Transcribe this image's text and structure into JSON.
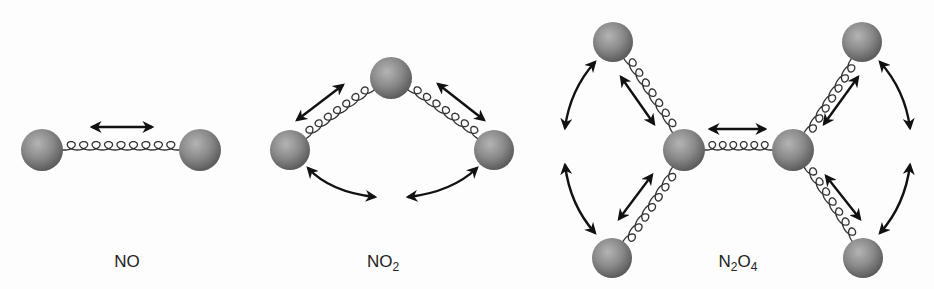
{
  "diagram": {
    "type": "molecular-vibration-modes",
    "molecules": [
      {
        "name": "NO",
        "label_main": "NO",
        "label_sub": "",
        "label_tail": "",
        "label_pos": [
          127,
          252
        ],
        "atoms": [
          [
            42,
            150,
            21
          ],
          [
            200,
            150,
            21
          ]
        ],
        "springs": [
          [
            42,
            150,
            200,
            150,
            9
          ]
        ],
        "straight_arrows": [
          [
            92,
            127,
            152,
            127
          ]
        ],
        "curved_arrows": []
      },
      {
        "name": "NO2",
        "label_main": "NO",
        "label_sub": "2",
        "label_tail": "",
        "label_pos": [
          383,
          252
        ],
        "atoms": [
          [
            290,
            150,
            20
          ],
          [
            391,
            78,
            21
          ],
          [
            494,
            150,
            20
          ]
        ],
        "springs": [
          [
            290,
            150,
            391,
            78,
            7
          ],
          [
            391,
            78,
            494,
            150,
            7
          ]
        ],
        "straight_arrows": [
          [
            297,
            120,
            343,
            85
          ],
          [
            438,
            84,
            484,
            120
          ]
        ],
        "curved_arrows": [
          [
            308,
            168,
            375,
            197,
            330,
            192
          ],
          [
            408,
            197,
            477,
            168,
            452,
            192
          ]
        ]
      },
      {
        "name": "N2O4",
        "label_main": "N",
        "label_sub": "2",
        "label_tail": "O",
        "label_sub2": "4",
        "label_pos": [
          738,
          252
        ],
        "atoms": [
          [
            613,
            42,
            20
          ],
          [
            862,
            42,
            20
          ],
          [
            684,
            150,
            21
          ],
          [
            793,
            150,
            21
          ],
          [
            612,
            258,
            20
          ],
          [
            863,
            258,
            20
          ]
        ],
        "springs": [
          [
            613,
            42,
            684,
            150,
            7
          ],
          [
            684,
            150,
            612,
            258,
            7
          ],
          [
            684,
            150,
            793,
            150,
            6
          ],
          [
            862,
            42,
            793,
            150,
            7
          ],
          [
            793,
            150,
            863,
            258,
            7
          ]
        ],
        "straight_arrows": [
          [
            621,
            77,
            654,
            124
          ],
          [
            619,
            219,
            652,
            175
          ],
          [
            710,
            129,
            765,
            129
          ],
          [
            824,
            124,
            858,
            77
          ],
          [
            826,
            176,
            860,
            219
          ]
        ],
        "curved_arrows": [
          [
            595,
            62,
            565,
            128,
            570,
            90
          ],
          [
            565,
            165,
            595,
            233,
            570,
            205
          ],
          [
            880,
            62,
            910,
            128,
            905,
            90
          ],
          [
            910,
            165,
            880,
            233,
            905,
            205
          ]
        ]
      }
    ],
    "colors": {
      "atom_light": "#b4b4b4",
      "atom_mid": "#8a8a8a",
      "atom_dark": "#5c5c5c",
      "spring": "#333333",
      "arrow": "#111111",
      "text": "#222222"
    }
  }
}
